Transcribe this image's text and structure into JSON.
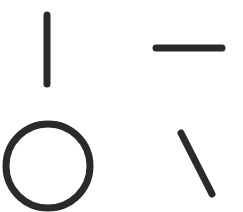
{
  "canvas": {
    "width": 243,
    "height": 212,
    "background": "#ffffff"
  },
  "stroke": {
    "color": "#2a2a2a",
    "width": 7
  },
  "shapes": {
    "vertical_line": {
      "x1": 47,
      "y1": 15,
      "x2": 47,
      "y2": 84
    },
    "horizontal_line": {
      "x1": 156,
      "y1": 48,
      "x2": 222,
      "y2": 48
    },
    "circle": {
      "cx": 48,
      "cy": 166,
      "r": 42
    },
    "diagonal_line": {
      "x1": 181,
      "y1": 133,
      "x2": 212,
      "y2": 194
    }
  }
}
